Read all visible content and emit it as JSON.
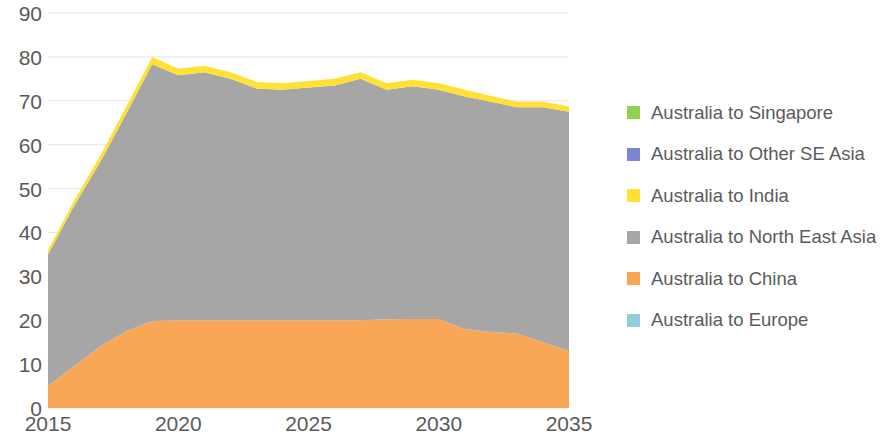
{
  "chart_data": {
    "type": "area",
    "stacked": true,
    "title": "",
    "subtitle": "",
    "xlabel": "",
    "ylabel": "",
    "xlim": [
      2015,
      2035
    ],
    "ylim": [
      0,
      90
    ],
    "ytick_step": 10,
    "xtick_step": 5,
    "grid": true,
    "grid_axis": "y",
    "legend_position": "right",
    "x": [
      2015,
      2016,
      2017,
      2018,
      2019,
      2020,
      2021,
      2022,
      2023,
      2024,
      2025,
      2026,
      2027,
      2028,
      2029,
      2030,
      2031,
      2032,
      2033,
      2034,
      2035
    ],
    "y_ticks": [
      "0",
      "10",
      "20",
      "30",
      "40",
      "50",
      "60",
      "70",
      "80",
      "90"
    ],
    "x_ticks": [
      "2015",
      "2020",
      "2025",
      "2030",
      "2035"
    ],
    "series": [
      {
        "name": "Australia to Europe",
        "color": "#92CDDC",
        "values": [
          0,
          0,
          0,
          0,
          0,
          0,
          0,
          0,
          0,
          0,
          0,
          0,
          0,
          0,
          0,
          0,
          0,
          0,
          0,
          0,
          0
        ]
      },
      {
        "name": "Australia to China",
        "color": "#F9A657",
        "values": [
          5.0,
          9.5,
          14.0,
          17.5,
          19.8,
          20.0,
          20.0,
          20.0,
          20.0,
          20.0,
          20.0,
          20.0,
          20.0,
          20.2,
          20.3,
          20.3,
          18.0,
          17.3,
          17.0,
          15.0,
          13.0
        ]
      },
      {
        "name": "Australia to North East Asia",
        "color": "#A6A6A6",
        "values": [
          30.0,
          36.5,
          42.0,
          49.5,
          58.5,
          55.8,
          56.5,
          55.0,
          52.8,
          52.5,
          53.0,
          53.5,
          55.0,
          52.3,
          53.0,
          52.2,
          53.0,
          52.5,
          51.5,
          53.5,
          54.5
        ]
      },
      {
        "name": "Australia to India",
        "color": "#FFE033",
        "values": [
          1.0,
          1.2,
          1.4,
          1.6,
          1.7,
          1.5,
          1.5,
          1.5,
          1.5,
          1.5,
          1.5,
          1.5,
          1.5,
          1.5,
          1.5,
          1.5,
          1.5,
          1.3,
          1.3,
          1.3,
          1.2
        ]
      },
      {
        "name": "Australia to Other SE Asia",
        "color": "#7B85D4",
        "values": [
          0,
          0,
          0,
          0,
          0,
          0,
          0,
          0,
          0,
          0,
          0,
          0,
          0,
          0,
          0,
          0,
          0,
          0,
          0,
          0,
          0
        ]
      },
      {
        "name": "Australia to Singapore",
        "color": "#92D050",
        "values": [
          0,
          0,
          0,
          0,
          0,
          0,
          0,
          0,
          0,
          0,
          0,
          0,
          0,
          0,
          0,
          0,
          0,
          0,
          0,
          0,
          0
        ]
      }
    ],
    "totals": [
      36.0,
      47.2,
      57.4,
      68.6,
      80.0,
      77.3,
      78.0,
      76.5,
      74.3,
      74.0,
      74.5,
      75.0,
      76.5,
      74.0,
      74.8,
      74.0,
      72.5,
      71.1,
      69.8,
      69.8,
      68.7
    ]
  },
  "legend": {
    "items": [
      {
        "label": "Australia to Singapore",
        "color": "#92D050"
      },
      {
        "label": "Australia to Other SE Asia",
        "color": "#7B85D4"
      },
      {
        "label": "Australia to India",
        "color": "#FFE033"
      },
      {
        "label": "Australia to North East Asia",
        "color": "#A6A6A6"
      },
      {
        "label": "Australia to China",
        "color": "#F9A657"
      },
      {
        "label": "Australia to Europe",
        "color": "#92CDDC"
      }
    ]
  },
  "style": {
    "gridline_color": "#E8E8E8",
    "axis_text_color": "#5a5a5a",
    "background": "#ffffff"
  }
}
